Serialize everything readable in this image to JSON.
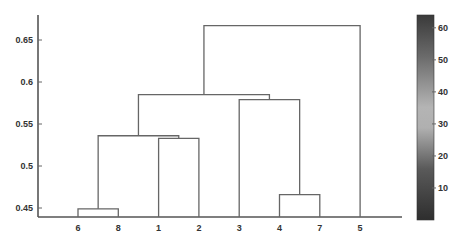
{
  "chart_data": {
    "type": "dendrogram",
    "title": "",
    "xlabel": "",
    "ylabel": "",
    "leaf_order": [
      "6",
      "8",
      "1",
      "2",
      "3",
      "4",
      "7",
      "5"
    ],
    "ylim": [
      0.438,
      0.675
    ],
    "yticks": [
      0.45,
      0.5,
      0.55,
      0.6,
      0.65
    ],
    "ytick_labels": [
      "0.45",
      "0.5",
      "0.55",
      "0.6",
      "0.65"
    ],
    "merges": [
      {
        "left": "6",
        "right": "8",
        "height": 0.449
      },
      {
        "left": "1",
        "right": "2",
        "height": 0.533
      },
      {
        "left": "(6,8)",
        "right": "(1,2)",
        "height": 0.536
      },
      {
        "left": "4",
        "right": "7",
        "height": 0.466
      },
      {
        "left": "3",
        "right": "(4,7)",
        "height": 0.579
      },
      {
        "left": "((6,8),(1,2))",
        "right": "(3,(4,7))",
        "height": 0.585
      },
      {
        "left": "(((6,8),(1,2)),(3,(4,7)))",
        "right": "5",
        "height": 0.667
      }
    ],
    "colorbar": {
      "range": [
        0,
        64
      ],
      "ticks": [
        10,
        20,
        30,
        40,
        50,
        60
      ],
      "tick_labels": [
        "10",
        "20",
        "30",
        "40",
        "50",
        "60"
      ],
      "colormap": "grayscale (dark - light - dark)"
    },
    "grid": false,
    "legend": null
  },
  "colors": {
    "axis": "#555555",
    "link": "#666666",
    "text": "#333333"
  }
}
